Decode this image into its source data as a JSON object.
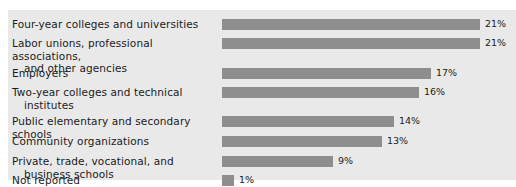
{
  "chart_data": {
    "type": "bar",
    "orientation": "horizontal",
    "title": "",
    "xlabel": "",
    "ylabel": "",
    "xlim": [
      0,
      24
    ],
    "grid": false,
    "legend": false,
    "value_suffix": "%",
    "categories": [
      "Four-year colleges and universities",
      "Labor unions, professional associations, and other agencies",
      "Employers",
      "Two-year colleges and technical institutes",
      "Public elementary and secondary schools",
      "Community organizations",
      "Private, trade, vocational, and business schools",
      "Not reported"
    ],
    "values": [
      21,
      21,
      17,
      16,
      14,
      13,
      9,
      1
    ],
    "value_labels": [
      "21%",
      "21%",
      "17%",
      "16%",
      "14%",
      "13%",
      "9%",
      "1%"
    ]
  },
  "rows": [
    {
      "line1": "Four-year colleges and universities",
      "line2": "",
      "value": 21,
      "value_label": "21%"
    },
    {
      "line1": "Labor unions, professional associations,",
      "line2": "and other agencies",
      "value": 21,
      "value_label": "21%"
    },
    {
      "line1": "Employers",
      "line2": "",
      "value": 17,
      "value_label": "17%"
    },
    {
      "line1": "Two-year colleges and technical",
      "line2": "institutes",
      "value": 16,
      "value_label": "16%"
    },
    {
      "line1": "Public elementary and secondary schools",
      "line2": "",
      "value": 14,
      "value_label": "14%"
    },
    {
      "line1": "Community organizations",
      "line2": "",
      "value": 13,
      "value_label": "13%"
    },
    {
      "line1": "Private, trade, vocational, and",
      "line2": "business schools",
      "value": 9,
      "value_label": "9%"
    },
    {
      "line1": "Not reported",
      "line2": "",
      "value": 1,
      "value_label": "1%"
    }
  ],
  "style": {
    "panel_background": "#e9e9e9",
    "page_background": "#ffffff",
    "bar_color": "#8e8e8e",
    "text_color": "#1b1b1b"
  },
  "layout": {
    "row_tops": [
      8,
      27,
      57,
      76,
      105,
      125,
      145,
      164
    ],
    "px_per_unit": 12.3,
    "bar_min_width": 12
  }
}
